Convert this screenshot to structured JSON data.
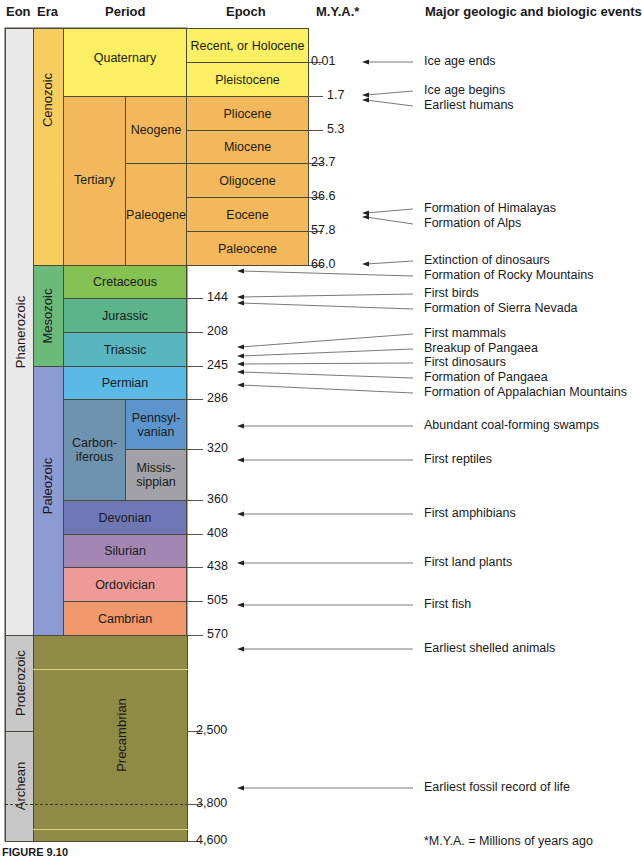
{
  "headers": {
    "eon": "Eon",
    "era": "Era",
    "period": "Period",
    "epoch": "Epoch",
    "mya": "M.Y.A.*",
    "events": "Major geologic and biologic events"
  },
  "eons": [
    {
      "name": "Phanerozoic",
      "top": 28,
      "bottom": 635,
      "color": "#e9e9e9"
    },
    {
      "name": "Proterozoic",
      "top": 635,
      "bottom": 731,
      "color": "#c7c7c7"
    },
    {
      "name": "Archean",
      "top": 731,
      "bottom": 841,
      "color": "#c7c7c7"
    }
  ],
  "eras": [
    {
      "name": "Cenozoic",
      "top": 28,
      "bottom": 265,
      "color": "#f7cd60"
    },
    {
      "name": "Mesozoic",
      "top": 265,
      "bottom": 366,
      "color": "#6cba7a"
    },
    {
      "name": "Paleozoic",
      "top": 366,
      "bottom": 635,
      "color": "#8d9bd3"
    },
    {
      "name": "Precambrian",
      "top": 635,
      "bottom": 841,
      "color": "#8f8a45"
    }
  ],
  "periods": [
    {
      "name": "Quaternary",
      "top": 28,
      "bottom": 96,
      "color": "#fbf064"
    },
    {
      "name": "Tertiary",
      "top": 96,
      "bottom": 265,
      "color": "#f4b85c"
    },
    {
      "name": "Cretaceous",
      "top": 265,
      "bottom": 298,
      "color": "#86c154"
    },
    {
      "name": "Jurassic",
      "top": 298,
      "bottom": 332,
      "color": "#5cb48c"
    },
    {
      "name": "Triassic",
      "top": 332,
      "bottom": 366,
      "color": "#5ab6be"
    },
    {
      "name": "Permian",
      "top": 366,
      "bottom": 399,
      "color": "#5ab9e6"
    },
    {
      "name": "Carbon-\niferous",
      "top": 399,
      "bottom": 500,
      "color": "#6f92ae"
    },
    {
      "name": "Devonian",
      "top": 500,
      "bottom": 534,
      "color": "#6f78b4"
    },
    {
      "name": "Silurian",
      "top": 534,
      "bottom": 567,
      "color": "#a387b2"
    },
    {
      "name": "Ordovician",
      "top": 567,
      "bottom": 601,
      "color": "#ee9a98"
    },
    {
      "name": "Cambrian",
      "top": 601,
      "bottom": 635,
      "color": "#f0996c"
    }
  ],
  "subperiods": [
    {
      "name": "Neogene",
      "top": 96,
      "bottom": 163,
      "color": "#f4b85c"
    },
    {
      "name": "Paleogene",
      "top": 163,
      "bottom": 265,
      "color": "#f4b85c"
    },
    {
      "name": "Pennsyl-\nvanian",
      "top": 399,
      "bottom": 449,
      "color": "#5b95cc"
    },
    {
      "name": "Missis-\nsippian",
      "top": 449,
      "bottom": 500,
      "color": "#a1a1a6"
    }
  ],
  "epochs": [
    {
      "name": "Recent, or Holocene",
      "top": 28,
      "bottom": 62,
      "color": "#fbf064"
    },
    {
      "name": "Pleistocene",
      "top": 62,
      "bottom": 96,
      "color": "#fbf064"
    },
    {
      "name": "Pliocene",
      "top": 96,
      "bottom": 130,
      "color": "#f4b85c"
    },
    {
      "name": "Miocene",
      "top": 130,
      "bottom": 163,
      "color": "#f4b85c"
    },
    {
      "name": "Oligocene",
      "top": 163,
      "bottom": 197,
      "color": "#f4b85c"
    },
    {
      "name": "Eocene",
      "top": 197,
      "bottom": 231,
      "color": "#f4b85c"
    },
    {
      "name": "Paleocene",
      "top": 231,
      "bottom": 265,
      "color": "#f4b85c"
    }
  ],
  "mya_labels": [
    {
      "value": "0.01",
      "y": 62,
      "x": 327
    },
    {
      "value": "1.7",
      "y": 96,
      "x": 327
    },
    {
      "value": "5.3",
      "y": 130,
      "x": 327
    },
    {
      "value": "23.7",
      "y": 163,
      "x": 311
    },
    {
      "value": "36.6",
      "y": 197,
      "x": 311
    },
    {
      "value": "57.8",
      "y": 231,
      "x": 311
    },
    {
      "value": "66.0",
      "y": 265,
      "x": 311
    },
    {
      "value": "144",
      "y": 298,
      "x": 207
    },
    {
      "value": "208",
      "y": 332,
      "x": 207
    },
    {
      "value": "245",
      "y": 366,
      "x": 207
    },
    {
      "value": "286",
      "y": 399,
      "x": 207
    },
    {
      "value": "320",
      "y": 449,
      "x": 207
    },
    {
      "value": "360",
      "y": 500,
      "x": 207
    },
    {
      "value": "408",
      "y": 534,
      "x": 207
    },
    {
      "value": "438",
      "y": 567,
      "x": 207
    },
    {
      "value": "505",
      "y": 601,
      "x": 207
    },
    {
      "value": "570",
      "y": 635,
      "x": 207
    },
    {
      "value": "2,500",
      "y": 731,
      "x": 196
    },
    {
      "value": "3,800",
      "y": 804,
      "x": 196
    },
    {
      "value": "4,600",
      "y": 841,
      "x": 196
    }
  ],
  "events": [
    {
      "label": "Ice age ends",
      "text_y": 62,
      "arrow_y": 62
    },
    {
      "label": "Ice age begins",
      "text_y": 91,
      "arrow_y": 95
    },
    {
      "label": "Earliest humans",
      "text_y": 106,
      "arrow_y": 100
    },
    {
      "label": "Formation of Himalayas",
      "text_y": 209,
      "arrow_y": 213
    },
    {
      "label": "Formation of Alps",
      "text_y": 224,
      "arrow_y": 217
    },
    {
      "label": "Extinction of dinosaurs",
      "text_y": 261,
      "arrow_y": 264
    },
    {
      "label": "Formation of Rocky Mountains",
      "text_y": 276,
      "arrow_y": 271
    },
    {
      "label": "First birds",
      "text_y": 294,
      "arrow_y": 297
    },
    {
      "label": "Formation of Sierra Nevada",
      "text_y": 309,
      "arrow_y": 303
    },
    {
      "label": "First mammals",
      "text_y": 334,
      "arrow_y": 347
    },
    {
      "label": "Breakup of Pangaea",
      "text_y": 349,
      "arrow_y": 356
    },
    {
      "label": "First dinosaurs",
      "text_y": 363,
      "arrow_y": 364
    },
    {
      "label": "Formation of Pangaea",
      "text_y": 378,
      "arrow_y": 372
    },
    {
      "label": "Formation of Appalachian Mountains",
      "text_y": 393,
      "arrow_y": 385
    },
    {
      "label": "Abundant coal-forming swamps",
      "text_y": 426,
      "arrow_y": 426
    },
    {
      "label": "First reptiles",
      "text_y": 460,
      "arrow_y": 460
    },
    {
      "label": "First amphibians",
      "text_y": 514,
      "arrow_y": 514
    },
    {
      "label": "First land plants",
      "text_y": 563,
      "arrow_y": 563
    },
    {
      "label": "First fish",
      "text_y": 605,
      "arrow_y": 605
    },
    {
      "label": "Earliest shelled animals",
      "text_y": 649,
      "arrow_y": 649
    },
    {
      "label": "Earliest fossil record of life",
      "text_y": 788,
      "arrow_y": 788
    }
  ],
  "footnote": "*M.Y.A. = Millions of years ago",
  "figure_label": "FIGURE 9.10",
  "chart_data": {
    "type": "table",
    "columns": [
      "Eon",
      "Era",
      "Period",
      "Epoch",
      "M.Y.A.*",
      "Major geologic and biologic events"
    ],
    "boundaries_mya": [
      0.01,
      1.7,
      5.3,
      23.7,
      36.6,
      57.8,
      66.0,
      144,
      208,
      245,
      286,
      320,
      360,
      408,
      438,
      505,
      570,
      2500,
      3800,
      4600
    ],
    "rows": [
      {
        "eon": "Phanerozoic",
        "era": "Cenozoic",
        "period": "Quaternary",
        "epoch": "Recent, or Holocene",
        "start_mya": 0.01
      },
      {
        "eon": "Phanerozoic",
        "era": "Cenozoic",
        "period": "Quaternary",
        "epoch": "Pleistocene",
        "start_mya": 1.7
      },
      {
        "eon": "Phanerozoic",
        "era": "Cenozoic",
        "period": "Tertiary / Neogene",
        "epoch": "Pliocene",
        "start_mya": 5.3
      },
      {
        "eon": "Phanerozoic",
        "era": "Cenozoic",
        "period": "Tertiary / Neogene",
        "epoch": "Miocene",
        "start_mya": 23.7
      },
      {
        "eon": "Phanerozoic",
        "era": "Cenozoic",
        "period": "Tertiary / Paleogene",
        "epoch": "Oligocene",
        "start_mya": 36.6
      },
      {
        "eon": "Phanerozoic",
        "era": "Cenozoic",
        "period": "Tertiary / Paleogene",
        "epoch": "Eocene",
        "start_mya": 57.8
      },
      {
        "eon": "Phanerozoic",
        "era": "Cenozoic",
        "period": "Tertiary / Paleogene",
        "epoch": "Paleocene",
        "start_mya": 66.0
      },
      {
        "eon": "Phanerozoic",
        "era": "Mesozoic",
        "period": "Cretaceous",
        "start_mya": 144
      },
      {
        "eon": "Phanerozoic",
        "era": "Mesozoic",
        "period": "Jurassic",
        "start_mya": 208
      },
      {
        "eon": "Phanerozoic",
        "era": "Mesozoic",
        "period": "Triassic",
        "start_mya": 245
      },
      {
        "eon": "Phanerozoic",
        "era": "Paleozoic",
        "period": "Permian",
        "start_mya": 286
      },
      {
        "eon": "Phanerozoic",
        "era": "Paleozoic",
        "period": "Carboniferous / Pennsylvanian",
        "start_mya": 320
      },
      {
        "eon": "Phanerozoic",
        "era": "Paleozoic",
        "period": "Carboniferous / Mississippian",
        "start_mya": 360
      },
      {
        "eon": "Phanerozoic",
        "era": "Paleozoic",
        "period": "Devonian",
        "start_mya": 408
      },
      {
        "eon": "Phanerozoic",
        "era": "Paleozoic",
        "period": "Silurian",
        "start_mya": 438
      },
      {
        "eon": "Phanerozoic",
        "era": "Paleozoic",
        "period": "Ordovician",
        "start_mya": 505
      },
      {
        "eon": "Phanerozoic",
        "era": "Paleozoic",
        "period": "Cambrian",
        "start_mya": 570
      },
      {
        "eon": "Proterozoic",
        "era": "Precambrian",
        "start_mya": 2500
      },
      {
        "eon": "Archean",
        "era": "Precambrian",
        "start_mya": 4600
      }
    ],
    "events": [
      "Ice age ends",
      "Ice age begins",
      "Earliest humans",
      "Formation of Himalayas",
      "Formation of Alps",
      "Extinction of dinosaurs",
      "Formation of Rocky Mountains",
      "First birds",
      "Formation of Sierra Nevada",
      "First mammals",
      "Breakup of Pangaea",
      "First dinosaurs",
      "Formation of Pangaea",
      "Formation of Appalachian Mountains",
      "Abundant coal-forming swamps",
      "First reptiles",
      "First amphibians",
      "First land plants",
      "First fish",
      "Earliest shelled animals",
      "Earliest fossil record of life"
    ]
  }
}
